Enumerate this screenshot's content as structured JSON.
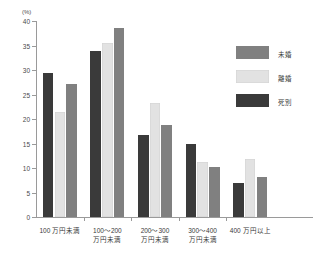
{
  "chart_data": {
    "type": "bar",
    "title": "",
    "subtitle": "",
    "xlabel": "",
    "ylabel": "(%)",
    "unit_label": "(%)",
    "ylim": [
      0,
      40
    ],
    "ytick_step": 5,
    "yticks": [
      "0",
      "5",
      "10",
      "15",
      "20",
      "25",
      "30",
      "35",
      "40"
    ],
    "grid": false,
    "legend_position": "right",
    "categories": [
      "100 万円未満",
      "100〜200\n万円未満",
      "200〜300\n万円未満",
      "300〜400\n万円未満",
      "400 万円以上"
    ],
    "series": [
      {
        "name": "未婚",
        "color": "#808080",
        "values": [
          27.2,
          38.5,
          18.7,
          10.3,
          8.2
        ]
      },
      {
        "name": "離婚",
        "color": "#e2e2e2",
        "values": [
          21.5,
          35.6,
          23.2,
          11.2,
          11.8
        ]
      },
      {
        "name": "死別",
        "color": "#3a3a3a",
        "values": [
          29.3,
          33.8,
          16.8,
          15.0,
          6.9
        ]
      }
    ],
    "bar_draw_order": [
      "死別",
      "離婚",
      "未婚"
    ],
    "legend": [
      {
        "label": "未婚",
        "color": "#808080"
      },
      {
        "label": "離婚",
        "color": "#e2e2e2"
      },
      {
        "label": "死別",
        "color": "#3a3a3a"
      }
    ],
    "axis_color": "#9a9a9a"
  }
}
